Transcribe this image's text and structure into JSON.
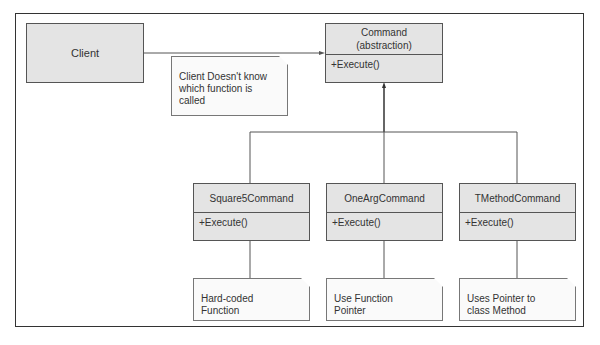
{
  "client": {
    "label": "Client"
  },
  "command": {
    "title_line1": "Command",
    "title_line2": "(abstraction)",
    "method": "+Execute()"
  },
  "client_note": {
    "lines": [
      "Client Doesn't know",
      "which function is",
      "called"
    ]
  },
  "subclasses": [
    {
      "name": "Square5Command",
      "method": "+Execute()",
      "note": [
        "Hard-coded",
        "Function"
      ]
    },
    {
      "name": "OneArgCommand",
      "method": "+Execute()",
      "note": [
        "Use Function",
        "Pointer"
      ]
    },
    {
      "name": "TMethodCommand",
      "method": "+Execute()",
      "note": [
        "Uses Pointer to",
        "class Method"
      ]
    }
  ]
}
